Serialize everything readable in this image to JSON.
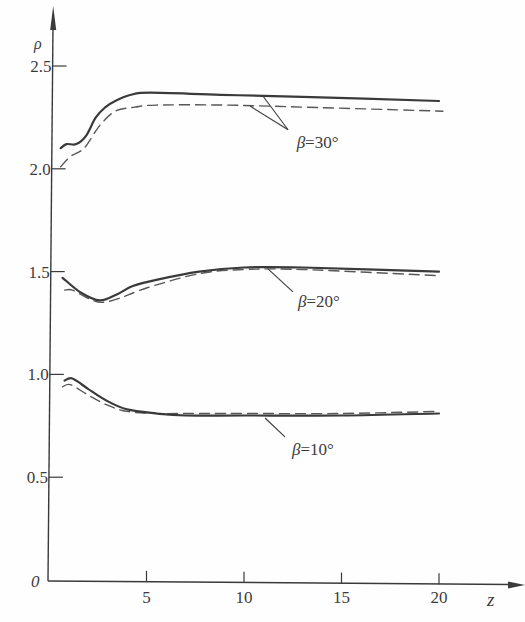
{
  "chart_data": {
    "type": "line",
    "title": "",
    "xlabel": "z",
    "ylabel": "ρ",
    "origin_label": "0",
    "grid": false,
    "legend": null,
    "xlim": [
      0,
      21.5
    ],
    "ylim": [
      0,
      2.75
    ],
    "x_ticks": [
      {
        "value": 5,
        "label": "5"
      },
      {
        "value": 10,
        "label": "10"
      },
      {
        "value": 15,
        "label": "15"
      },
      {
        "value": 20,
        "label": "20"
      }
    ],
    "y_ticks": [
      {
        "value": 0.5,
        "label": "0.5"
      },
      {
        "value": 1.0,
        "label": "1.0"
      },
      {
        "value": 1.5,
        "label": "1.5"
      },
      {
        "value": 2.0,
        "label": "2.0"
      },
      {
        "value": 2.5,
        "label": "2.5"
      }
    ],
    "series": [
      {
        "name": "β=30° solid",
        "group": "β=30°",
        "style": "solid",
        "x": [
          0.6,
          0.9,
          1.4,
          1.9,
          2.4,
          2.9,
          3.4,
          4.2,
          5.2,
          8.8,
          13.0,
          20.0
        ],
        "y": [
          2.1,
          2.12,
          2.12,
          2.16,
          2.25,
          2.3,
          2.33,
          2.36,
          2.37,
          2.36,
          2.35,
          2.33
        ]
      },
      {
        "name": "β=30° dashed",
        "group": "β=30°",
        "style": "dashed",
        "x": [
          0.6,
          1.1,
          1.8,
          2.6,
          3.4,
          4.4,
          5.5,
          9.0,
          13.0,
          20.2
        ],
        "y": [
          2.01,
          2.06,
          2.1,
          2.21,
          2.28,
          2.3,
          2.31,
          2.31,
          2.3,
          2.28
        ]
      },
      {
        "name": "β=20° solid",
        "group": "β=20°",
        "style": "solid",
        "x": [
          0.7,
          1.6,
          2.6,
          3.5,
          4.3,
          5.5,
          7.7,
          10.0,
          13.0,
          20.0
        ],
        "y": [
          1.47,
          1.4,
          1.36,
          1.39,
          1.43,
          1.46,
          1.5,
          1.52,
          1.52,
          1.5
        ]
      },
      {
        "name": "β=20° dashed",
        "group": "β=20°",
        "style": "dashed",
        "x": [
          0.8,
          1.2,
          2.0,
          2.7,
          3.6,
          5.0,
          7.7,
          10.0,
          13.0,
          20.0
        ],
        "y": [
          1.41,
          1.41,
          1.37,
          1.35,
          1.37,
          1.42,
          1.49,
          1.51,
          1.51,
          1.48
        ]
      },
      {
        "name": "β=10° solid",
        "group": "β=10°",
        "style": "solid",
        "x": [
          0.8,
          1.2,
          2.0,
          3.0,
          4.0,
          5.5,
          7.0,
          10.0,
          15.0,
          20.0
        ],
        "y": [
          0.97,
          0.98,
          0.93,
          0.87,
          0.83,
          0.81,
          0.8,
          0.8,
          0.8,
          0.81
        ]
      },
      {
        "name": "β=10° dashed",
        "group": "β=10°",
        "style": "dashed",
        "x": [
          0.7,
          1.1,
          2.0,
          3.0,
          4.0,
          5.5,
          7.0,
          10.0,
          15.0,
          20.0
        ],
        "y": [
          0.94,
          0.95,
          0.9,
          0.85,
          0.82,
          0.81,
          0.81,
          0.81,
          0.81,
          0.82
        ]
      }
    ],
    "annotations": [
      {
        "text_symbol": "β",
        "text_value": "=30°",
        "text_at": [
          12.7,
          2.1
        ],
        "leaders": [
          [
            [
              12.26,
              2.19
            ],
            [
              10.97,
              2.354
            ]
          ],
          [
            [
              12.26,
              2.19
            ],
            [
              10.31,
              2.305
            ]
          ]
        ]
      },
      {
        "text_symbol": "β",
        "text_value": "=20°",
        "text_at": [
          12.77,
          1.328
        ],
        "leaders": [
          [
            [
              12.51,
              1.401
            ],
            [
              11.23,
              1.513
            ]
          ]
        ]
      },
      {
        "text_symbol": "β",
        "text_value": "=10°",
        "text_at": [
          12.46,
          0.608
        ],
        "leaders": [
          [
            [
              12.1,
              0.696
            ],
            [
              11.08,
              0.788
            ]
          ]
        ]
      }
    ]
  },
  "style": {
    "ink": "#3a3a3a",
    "paper": "#fefefe"
  }
}
